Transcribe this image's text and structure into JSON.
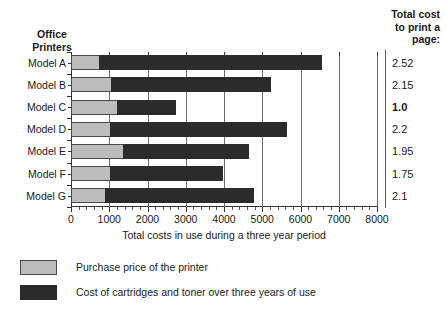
{
  "headers": {
    "left_line1": "Office",
    "left_line2": "Printers",
    "right_line1": "Total cost",
    "right_line2": "to print a",
    "right_line3": "page:"
  },
  "legend": {
    "items": [
      {
        "key": "purchase",
        "label": "Purchase price of the printer",
        "color": "#bcbcbc"
      },
      {
        "key": "cartridge",
        "label": "Cost of cartridges and toner over three years of use",
        "color": "#2b2b2b"
      }
    ]
  },
  "chart_data": {
    "type": "bar",
    "orientation": "horizontal",
    "stacked": true,
    "title": "",
    "xlabel": "Total costs in use during a three year period",
    "ylabel": "Office Printers",
    "xlim": [
      0,
      8000
    ],
    "xticks": [
      0,
      1000,
      2000,
      3000,
      4000,
      5000,
      6000,
      7000,
      8000
    ],
    "xticklabels": [
      "0",
      "1000",
      "2000",
      "3000",
      "4000",
      "5000",
      "6000",
      "7000",
      "8000"
    ],
    "grid": true,
    "legend_position": "below",
    "categories": [
      "Model A",
      "Model B",
      "Model C",
      "Model D",
      "Model E",
      "Model F",
      "Model G"
    ],
    "series": [
      {
        "name": "Purchase price of the printer",
        "color": "#bcbcbc",
        "values": [
          750,
          1070,
          1230,
          1050,
          1380,
          1050,
          920
        ]
      },
      {
        "name": "Cost of cartridges and toner over three years of use",
        "color": "#2b2b2b",
        "values": [
          5850,
          4180,
          1540,
          4620,
          3300,
          2950,
          3890
        ]
      }
    ],
    "totals": [
      6600,
      5250,
      2770,
      5670,
      4680,
      4000,
      4810
    ],
    "annotations": {
      "label": "Total cost to print a page:",
      "values": [
        "2.52",
        "2.15",
        "1.0",
        "2.2",
        "1.95",
        "1.75",
        "2.1"
      ],
      "emphasis_index": 2
    }
  }
}
